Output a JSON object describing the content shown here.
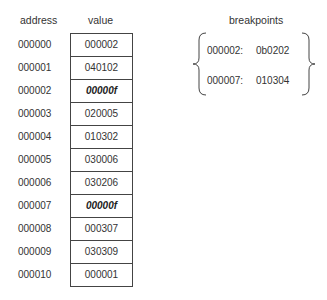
{
  "headers": {
    "address": "address",
    "value": "value",
    "breakpoints": "breakpoints"
  },
  "memory": [
    {
      "address": "000000",
      "value": "000002",
      "breakpoint": false
    },
    {
      "address": "000001",
      "value": "040102",
      "breakpoint": false
    },
    {
      "address": "000002",
      "value": "00000f",
      "breakpoint": true
    },
    {
      "address": "000003",
      "value": "020005",
      "breakpoint": false
    },
    {
      "address": "000004",
      "value": "010302",
      "breakpoint": false
    },
    {
      "address": "000005",
      "value": "030006",
      "breakpoint": false
    },
    {
      "address": "000006",
      "value": "030206",
      "breakpoint": false
    },
    {
      "address": "000007",
      "value": "00000f",
      "breakpoint": true
    },
    {
      "address": "000008",
      "value": "000307",
      "breakpoint": false
    },
    {
      "address": "000009",
      "value": "030309",
      "breakpoint": false
    },
    {
      "address": "000010",
      "value": "000001",
      "breakpoint": false
    }
  ],
  "breakpoints": [
    {
      "address": "000002:",
      "saved_value": "0b0202"
    },
    {
      "address": "000007:",
      "saved_value": "010304"
    }
  ]
}
